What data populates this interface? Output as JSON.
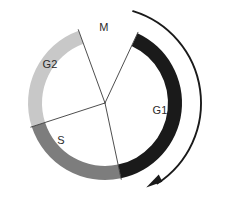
{
  "figure": {
    "background_color": "#ffffff",
    "width": 226,
    "height": 197
  },
  "chart_data": {
    "type": "pie",
    "subtitle": "",
    "xlabel": "",
    "ylabel": "",
    "legend_position": "inline-labels",
    "grid": false,
    "geometry": {
      "center_x": 105,
      "center_y": 103,
      "outer_radius": 77,
      "inner_radius": 63,
      "units": "pixels"
    },
    "categories": [
      "G1",
      "S",
      "G2",
      "M"
    ],
    "values": [
      143,
      84,
      88,
      45
    ],
    "value_units": "degrees of arc",
    "labels": [
      "G1",
      "S",
      "G2",
      "M"
    ],
    "colors": [
      "#1a1a1a",
      "#7d7d7d",
      "#c8c8c8",
      "#ffffff"
    ],
    "segments": [
      {
        "name": "G1",
        "label": "G1",
        "color": "#1a1a1a",
        "start_angle_deg": -65,
        "end_angle_deg": 78,
        "sweep_deg": 143,
        "label_x": 160,
        "label_y": 111
      },
      {
        "name": "S",
        "label": "S",
        "color": "#7d7d7d",
        "start_angle_deg": 78,
        "end_angle_deg": 162,
        "sweep_deg": 84,
        "label_x": 61,
        "label_y": 141
      },
      {
        "name": "G2",
        "label": "G2",
        "color": "#c8c8c8",
        "start_angle_deg": 162,
        "end_angle_deg": 250,
        "sweep_deg": 88,
        "label_x": 50,
        "label_y": 65
      },
      {
        "name": "M",
        "label": "M",
        "color": "#ffffff",
        "start_angle_deg": 250,
        "end_angle_deg": 295,
        "sweep_deg": 45,
        "label_x": 104,
        "label_y": 28
      }
    ],
    "dividers": [
      {
        "name": "divider-m-g1",
        "angle_deg": -65
      },
      {
        "name": "divider-s-g1",
        "angle_deg": 78
      },
      {
        "name": "divider-g2-s",
        "angle_deg": 162
      },
      {
        "name": "divider-g2-m",
        "angle_deg": 250
      }
    ],
    "direction_arrow": {
      "name": "cycle-direction-arrow",
      "direction": "clockwise",
      "color": "#1a1a1a",
      "start_angle_deg": -73,
      "end_angle_deg": 57,
      "radius": 96
    },
    "annotations": [
      "G1",
      "S",
      "G2",
      "M"
    ]
  }
}
